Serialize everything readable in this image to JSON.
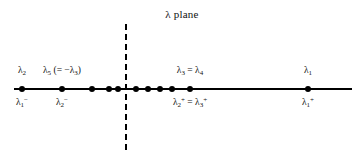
{
  "figure": {
    "title": "λ plane",
    "axis": {
      "name": "real-axis",
      "x_start": 14,
      "x_end": 352,
      "y": 88
    },
    "imaginary_axis": {
      "name": "imaginary-axis",
      "x": 126,
      "y_top": 24,
      "y_bottom": 150,
      "style": "dashed"
    },
    "colors": {
      "ink": "#000000",
      "text": "#111111",
      "background": "#ffffff"
    }
  },
  "points": [
    {
      "x": 22,
      "label_above": "λ₂",
      "label_below": "λ₁⁻"
    },
    {
      "x": 62,
      "label_above": "λ₅ (= −λ₃)",
      "label_below": "λ₂⁻"
    },
    {
      "x": 92,
      "label_above": "",
      "label_below": ""
    },
    {
      "x": 109,
      "label_above": "",
      "label_below": ""
    },
    {
      "x": 118,
      "label_above": "",
      "label_below": ""
    },
    {
      "x": 136,
      "label_above": "",
      "label_below": ""
    },
    {
      "x": 148,
      "label_above": "",
      "label_below": ""
    },
    {
      "x": 160,
      "label_above": "",
      "label_below": ""
    },
    {
      "x": 172,
      "label_above": "",
      "label_below": ""
    },
    {
      "x": 190,
      "label_above": "λ₃ = λ₄",
      "label_below": "λ₂⁺ = λ₃⁺"
    },
    {
      "x": 308,
      "label_above": "λ₁",
      "label_below": "λ₁⁺"
    }
  ]
}
